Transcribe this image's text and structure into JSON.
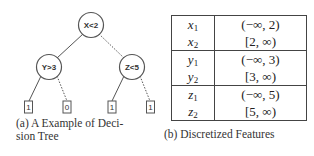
{
  "figure": {
    "panel_a": {
      "caption": "(a) A Example of Deci-",
      "caption_line2": "sion Tree",
      "tree": {
        "root": {
          "label": "X<2"
        },
        "left_child": {
          "label": "Y>3",
          "edge": "solid"
        },
        "right_child": {
          "label": "Z<5",
          "edge": "dotted"
        },
        "leaves": [
          {
            "label": "1",
            "parent": "Y>3",
            "edge": "solid"
          },
          {
            "label": "0",
            "parent": "Y>3",
            "edge": "dotted"
          },
          {
            "label": "1",
            "parent": "Z<5",
            "edge": "solid"
          },
          {
            "label": "1",
            "parent": "Z<5",
            "edge": "dotted"
          }
        ]
      }
    },
    "panel_b": {
      "caption": "(b) Discretized Features",
      "groups": [
        {
          "rows": [
            {
              "var": "x",
              "sub": "1",
              "interval": "(−∞, 2)"
            },
            {
              "var": "x",
              "sub": "2",
              "interval": "[2, ∞)"
            }
          ]
        },
        {
          "rows": [
            {
              "var": "y",
              "sub": "1",
              "interval": "(−∞, 3)"
            },
            {
              "var": "y",
              "sub": "2",
              "interval": "[3, ∞)"
            }
          ]
        },
        {
          "rows": [
            {
              "var": "z",
              "sub": "1",
              "interval": "(−∞, 5)"
            },
            {
              "var": "z",
              "sub": "2",
              "interval": "[5, ∞)"
            }
          ]
        }
      ]
    }
  }
}
